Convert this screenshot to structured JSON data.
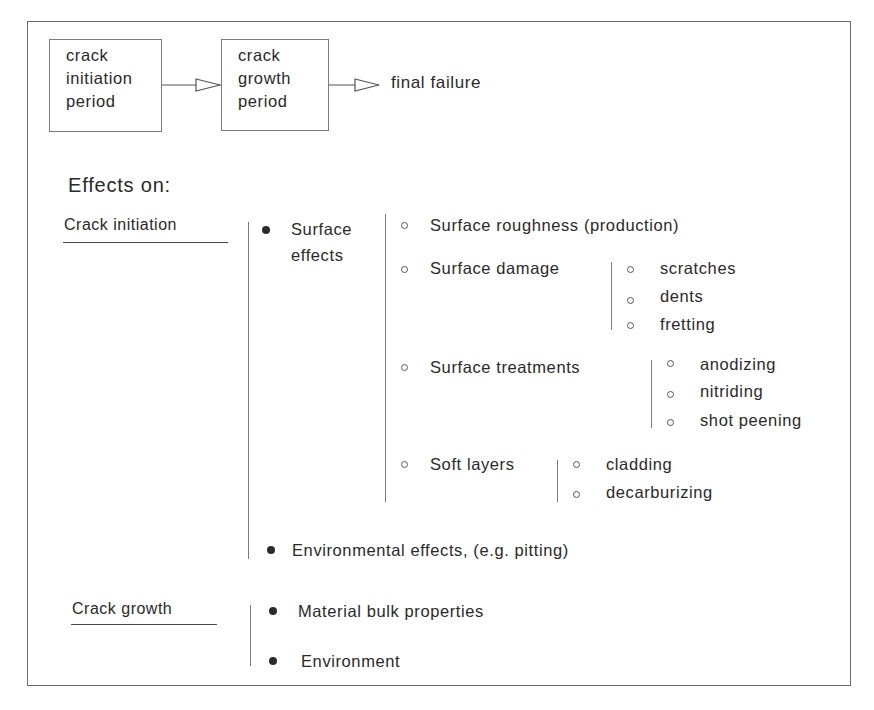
{
  "flow": {
    "box1": [
      "crack",
      "initiation",
      "period"
    ],
    "box2": [
      "crack",
      "growth",
      "period"
    ],
    "final": "final failure"
  },
  "heading": "Effects on:",
  "crack_initiation": {
    "label": "Crack initiation",
    "surface_effects": {
      "label_line1": "Surface",
      "label_line2": "effects",
      "items": [
        {
          "label": "Surface roughness (production)"
        },
        {
          "label": "Surface damage",
          "sub": [
            "scratches",
            "dents",
            "fretting"
          ]
        },
        {
          "label": "Surface treatments",
          "sub": [
            "anodizing",
            "nitriding",
            "shot peening"
          ]
        },
        {
          "label": "Soft layers",
          "sub": [
            "cladding",
            "decarburizing"
          ]
        }
      ]
    },
    "environmental": "Environmental effects, (e.g. pitting)"
  },
  "crack_growth": {
    "label": "Crack growth",
    "items": [
      "Material bulk properties",
      "Environment"
    ]
  },
  "colors": {
    "line": "#7a7a7a",
    "text": "#2a2a2a",
    "frame": "#6b6b6b"
  }
}
